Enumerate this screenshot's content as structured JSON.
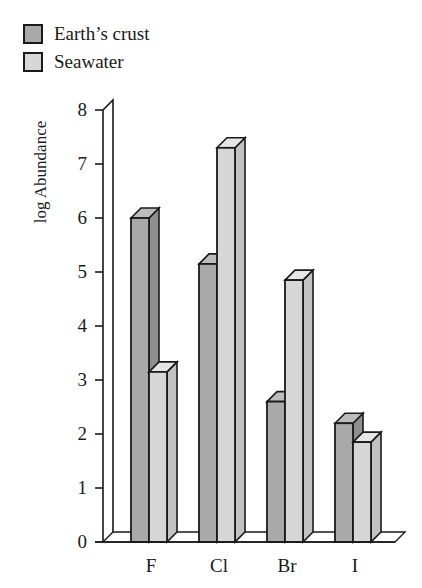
{
  "chart_data": {
    "type": "bar",
    "title": "",
    "xlabel": "",
    "ylabel": "log Abundance",
    "ylim": [
      0,
      8
    ],
    "yticks": [
      0,
      1,
      2,
      3,
      4,
      5,
      6,
      7,
      8
    ],
    "categories": [
      "F",
      "Cl",
      "Br",
      "I"
    ],
    "series": [
      {
        "name": "Earth’s crust",
        "color": "#a9a9a9",
        "values": [
          6.0,
          5.15,
          2.6,
          2.2
        ]
      },
      {
        "name": "Seawater",
        "color": "#d7d7d7",
        "values": [
          3.15,
          7.3,
          4.85,
          1.85
        ]
      }
    ],
    "grid": false,
    "legend_position": "top-left",
    "style": "3d-bar"
  },
  "legend": {
    "items": [
      {
        "label": "Earth’s crust",
        "color": "#a9a9a9"
      },
      {
        "label": "Seawater",
        "color": "#d7d7d7"
      }
    ]
  }
}
